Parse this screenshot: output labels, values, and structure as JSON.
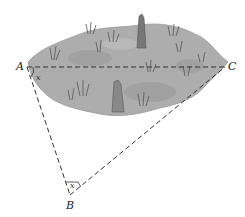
{
  "diagram": {
    "points": {
      "A": {
        "label": "A",
        "x": 27,
        "y": 67
      },
      "B": {
        "label": "B",
        "x": 70,
        "y": 195
      },
      "C": {
        "label": "C",
        "x": 225,
        "y": 67
      }
    },
    "angle_marks": {
      "A": "x",
      "B": "x"
    },
    "segments": [
      "AC",
      "AB",
      "BC"
    ],
    "region": "marsh",
    "colors": {
      "marsh_fill": "#a9a9a9",
      "marsh_dark": "#8c8c8c",
      "line": "#333333"
    }
  }
}
